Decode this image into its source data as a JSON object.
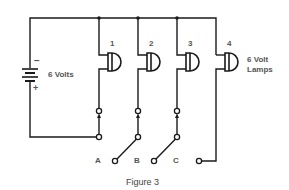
{
  "figure": {
    "caption": "Figure 3",
    "battery": {
      "label": "6 Volts",
      "minus": "−",
      "plus": "+"
    },
    "lamps": {
      "label_line1": "6 Volt",
      "label_line2": "Lamps",
      "items": [
        {
          "number": "1"
        },
        {
          "number": "2"
        },
        {
          "number": "3"
        },
        {
          "number": "4"
        }
      ]
    },
    "switches": [
      {
        "label": "A"
      },
      {
        "label": "B"
      },
      {
        "label": "C"
      }
    ],
    "colors": {
      "line": "#1a1a1a",
      "label": "#555555"
    }
  }
}
